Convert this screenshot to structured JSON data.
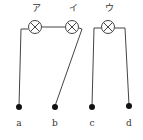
{
  "diagram": {
    "type": "circuit",
    "lamps": [
      {
        "id": "lamp-a",
        "label": "ア",
        "cx": 35,
        "cy": 27
      },
      {
        "id": "lamp-i",
        "label": "イ",
        "cx": 72,
        "cy": 27
      },
      {
        "id": "lamp-u",
        "label": "ウ",
        "cx": 108,
        "cy": 27
      }
    ],
    "terminals": [
      {
        "label": "a",
        "x": 19,
        "y": 107
      },
      {
        "label": "b",
        "x": 55,
        "y": 107
      },
      {
        "label": "c",
        "x": 92,
        "y": 107
      },
      {
        "label": "d",
        "x": 129,
        "y": 106
      }
    ],
    "colors": {
      "line": "#444444",
      "terminal": "#111111"
    }
  }
}
